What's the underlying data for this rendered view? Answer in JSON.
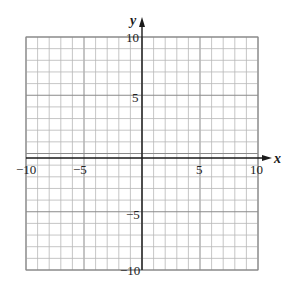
{
  "chart_data": {
    "type": "scatter",
    "title": "",
    "xlabel": "x",
    "ylabel": "y",
    "xlim": [
      -10,
      10
    ],
    "ylim": [
      -10,
      10
    ],
    "grid": true,
    "grid_minor_step": 1,
    "grid_major_step": 5,
    "x_tick_labels": [
      "-10",
      "-5",
      "5",
      "10"
    ],
    "y_tick_labels": [
      "10",
      "5",
      "-5",
      "-10"
    ],
    "series": []
  },
  "labels": {
    "x_axis": "x",
    "y_axis": "y",
    "x_ticks": {
      "neg10": "−10",
      "neg5": "−5",
      "pos5": "5",
      "pos10": "10"
    },
    "y_ticks": {
      "pos10": "10",
      "pos5": "5",
      "neg5": "−5",
      "neg10": "−10"
    }
  }
}
